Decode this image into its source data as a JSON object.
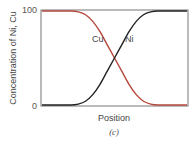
{
  "chart_data": {
    "type": "line",
    "title": "",
    "caption": "(c)",
    "xlabel": "Position",
    "ylabel": "Concentration of Ni, Cu",
    "ylim": [
      0,
      100
    ],
    "xlim": [
      0,
      1
    ],
    "y_ticks": [
      "0",
      "100"
    ],
    "grid": false,
    "annotations": [
      {
        "text": "Cu",
        "series": "Cu"
      },
      {
        "text": "Ni",
        "series": "Ni"
      }
    ],
    "x": [
      0.0,
      0.1,
      0.2,
      0.25,
      0.3,
      0.35,
      0.4,
      0.45,
      0.5,
      0.55,
      0.6,
      0.65,
      0.7,
      0.75,
      0.8,
      0.9,
      1.0
    ],
    "series": [
      {
        "name": "Cu",
        "color": "#b5473c",
        "values": [
          100,
          100,
          100,
          99,
          96,
          89,
          78,
          64,
          50,
          36,
          22,
          11,
          4,
          1,
          0,
          0,
          0
        ]
      },
      {
        "name": "Ni",
        "color": "#222222",
        "values": [
          0,
          0,
          0,
          1,
          4,
          11,
          22,
          36,
          50,
          64,
          78,
          89,
          96,
          99,
          100,
          100,
          100
        ]
      }
    ]
  }
}
